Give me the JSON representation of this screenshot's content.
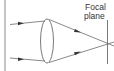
{
  "diagram": {
    "labels": {
      "focal_plane_line1": "Focal",
      "focal_plane_line2": "plane"
    },
    "elements": [
      "left-border",
      "lens",
      "incoming-ray-top",
      "incoming-ray-bottom",
      "refracted-ray-top",
      "refracted-ray-bottom",
      "focal-plane-line"
    ],
    "colors": {
      "stroke": "#6b6b6b",
      "arrow": "#333333",
      "text": "#333333"
    }
  }
}
